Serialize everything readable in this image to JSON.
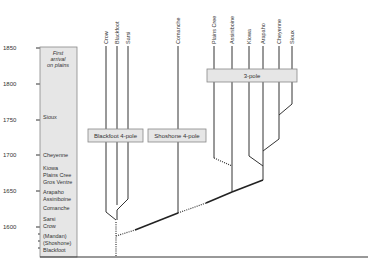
{
  "axis": {
    "ticks": [
      {
        "label": "1850",
        "y": 48
      },
      {
        "label": "1800",
        "y": 84
      },
      {
        "label": "1750",
        "y": 120
      },
      {
        "label": "1700",
        "y": 155
      },
      {
        "label": "1650",
        "y": 191
      },
      {
        "label": "1600",
        "y": 227
      }
    ]
  },
  "arrival_column": {
    "title_lines": [
      "First",
      "arrival",
      "on plains"
    ],
    "entries": [
      {
        "label": "Sioux",
        "y": 118
      },
      {
        "label": "Cheyenne",
        "y": 156
      },
      {
        "label": "Kiowa",
        "y": 169
      },
      {
        "label": "Plains Cree",
        "y": 176
      },
      {
        "label": "Gros Ventre",
        "y": 183
      },
      {
        "label": "Arapaho",
        "y": 193
      },
      {
        "label": "Assiniboine",
        "y": 200
      },
      {
        "label": "Comanche",
        "y": 209
      },
      {
        "label": "Sarsi",
        "y": 220
      },
      {
        "label": "Crow",
        "y": 227
      },
      {
        "label": "(Mandan)",
        "y": 237
      },
      {
        "label": "(Shoshone)",
        "y": 244
      },
      {
        "label": "Blackfoot",
        "y": 251
      }
    ]
  },
  "leaves": [
    {
      "label": "Crow",
      "x": 106
    },
    {
      "label": "Blackfoot",
      "x": 117
    },
    {
      "label": "Sarsi",
      "x": 128
    },
    {
      "label": "Comanche",
      "x": 178
    },
    {
      "label": "Plains Cree",
      "x": 243
    },
    {
      "label": "Assiniboine",
      "x": 232
    },
    {
      "label": "Kiowa",
      "x": 249
    },
    {
      "label": "Arapaho",
      "x": 263
    },
    {
      "label": "Cheyenne",
      "x": 279
    },
    {
      "label": "Sioux",
      "x": 292
    }
  ],
  "boxes": [
    {
      "label": "Blackfoot 4-pole"
    },
    {
      "label": "Shoshone 4-pole"
    },
    {
      "label": "3-pole"
    }
  ]
}
